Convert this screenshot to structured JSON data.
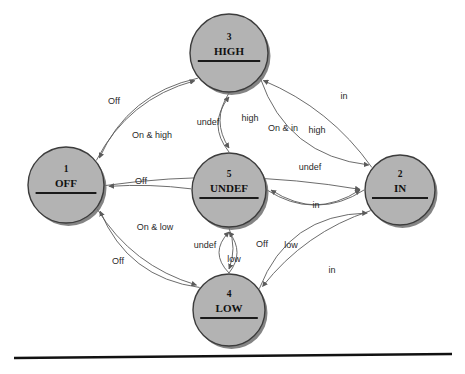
{
  "diagram": {
    "type": "state-machine",
    "background_color": "#ffffff",
    "node_fill_color": "#b3b3b3",
    "node_stroke_color": "#3c3c3c",
    "edge_color": "#5b5b5b",
    "nodes": [
      {
        "id": "off",
        "index": "1",
        "label": "OFF",
        "cx": 66,
        "cy": 185,
        "r": 38
      },
      {
        "id": "in",
        "index": "2",
        "label": "IN",
        "cx": 400,
        "cy": 190,
        "r": 35
      },
      {
        "id": "high",
        "index": "3",
        "label": "HIGH",
        "cx": 229,
        "cy": 53,
        "r": 39
      },
      {
        "id": "low",
        "index": "4",
        "label": "LOW",
        "cx": 229,
        "cy": 310,
        "r": 36
      },
      {
        "id": "undef",
        "index": "5",
        "label": "UNDEF",
        "cx": 229,
        "cy": 190,
        "r": 37
      }
    ],
    "edges": [
      {
        "id": "e-high-off",
        "from": "high",
        "to": "off",
        "label": "Off",
        "label_x": 114,
        "label_y": 104
      },
      {
        "id": "e-off-high",
        "from": "off",
        "to": "high",
        "label": "On & high",
        "label_x": 152,
        "label_y": 138
      },
      {
        "id": "e-high-undef",
        "from": "high",
        "to": "undef",
        "label": "undef",
        "label_x": 208,
        "label_y": 125
      },
      {
        "id": "e-undef-high",
        "from": "undef",
        "to": "high",
        "label": "high",
        "label_x": 250,
        "label_y": 121
      },
      {
        "id": "e-off-in",
        "from": "off",
        "to": "in",
        "label": "On & in",
        "label_x": 283,
        "label_y": 131
      },
      {
        "id": "e-in-high",
        "from": "in",
        "to": "high",
        "label": "high",
        "label_x": 317,
        "label_y": 133
      },
      {
        "id": "e-high-in",
        "from": "high",
        "to": "in",
        "label": "in",
        "label_x": 344,
        "label_y": 99
      },
      {
        "id": "e-undef-off",
        "from": "undef",
        "to": "off",
        "label": "Off",
        "label_x": 141,
        "label_y": 184
      },
      {
        "id": "e-undef-in",
        "from": "undef",
        "to": "in",
        "label": "undef",
        "label_x": 310,
        "label_y": 170
      },
      {
        "id": "e-in-undef",
        "from": "in",
        "to": "undef",
        "label": "in",
        "label_x": 316,
        "label_y": 208
      },
      {
        "id": "e-off-low",
        "from": "off",
        "to": "low",
        "label": "On & low",
        "label_x": 155,
        "label_y": 230
      },
      {
        "id": "e-low-off",
        "from": "low",
        "to": "off",
        "label": "Off",
        "label_x": 118,
        "label_y": 264
      },
      {
        "id": "e-low-undef",
        "from": "low",
        "to": "undef",
        "label": "undef",
        "label_x": 205,
        "label_y": 248
      },
      {
        "id": "e-undef-low",
        "from": "undef",
        "to": "low",
        "label": "low",
        "label_x": 234,
        "label_y": 262
      },
      {
        "id": "e-low-undef-2",
        "from": "low",
        "to": "undef",
        "label": "Off",
        "label_x": 262,
        "label_y": 247
      },
      {
        "id": "e-in-low",
        "from": "in",
        "to": "low",
        "label": "low",
        "label_x": 291,
        "label_y": 248
      },
      {
        "id": "e-low-in",
        "from": "low",
        "to": "in",
        "label": "in",
        "label_x": 332,
        "label_y": 273
      }
    ],
    "bottom_rule": {
      "x1": 14,
      "y1": 358,
      "x2": 452,
      "y2": 354
    }
  }
}
